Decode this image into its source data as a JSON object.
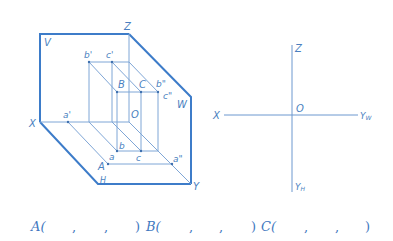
{
  "colors": {
    "frame": "#3d7cc9",
    "thin": "#7fa6d6",
    "text": "#4a7fc0"
  },
  "left_figure": {
    "planes": {
      "V": "V",
      "W": "W",
      "H": "H"
    },
    "axes": {
      "X": "X",
      "Y": "Y",
      "Z": "Z",
      "O": "O"
    },
    "points": {
      "A": "A",
      "B": "B",
      "C": "C",
      "a": "a",
      "b": "b",
      "c": "c",
      "a_prime": "a'",
      "b_prime": "b'",
      "c_prime": "c'",
      "a_dprime": "a\"",
      "b_dprime": "b\"",
      "c_dprime": "c\""
    }
  },
  "right_figure": {
    "axes": {
      "X": "X",
      "Z": "Z",
      "O": "O",
      "YW": "Y",
      "YW_sub": "W",
      "YH": "Y",
      "YH_sub": "H"
    }
  },
  "answer_row": {
    "A": "A(",
    "B": "B(",
    "C": "C(",
    "comma": ",",
    "close": ")"
  }
}
